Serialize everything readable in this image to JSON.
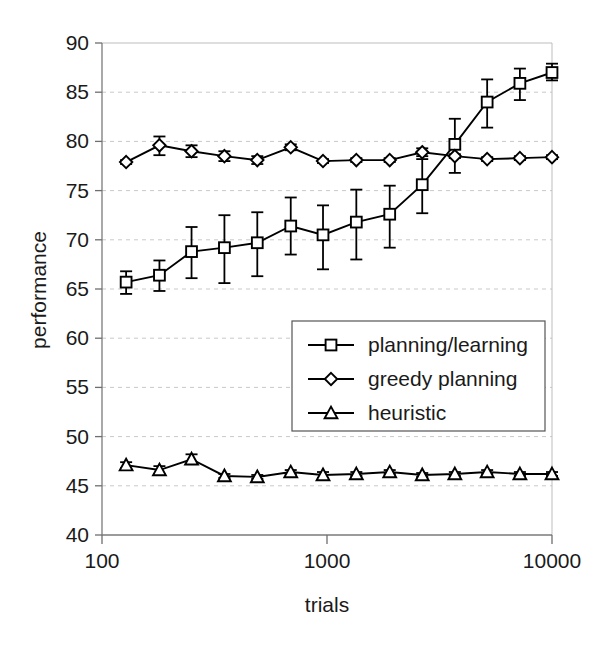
{
  "chart_data": {
    "type": "line",
    "title": "",
    "xlabel": "trials",
    "ylabel": "performance",
    "xscale": "log",
    "xlim": [
      100,
      10000
    ],
    "ylim": [
      40,
      90
    ],
    "ytick_labels": [
      "90",
      "85",
      "80",
      "75",
      "70",
      "65",
      "60",
      "55",
      "50",
      "45",
      "40"
    ],
    "yticks": [
      90,
      85,
      80,
      75,
      70,
      65,
      60,
      55,
      50,
      45,
      40
    ],
    "xtick_labels": [
      "100",
      "1000",
      "10000"
    ],
    "xticks": [
      100,
      1000,
      10000
    ],
    "grid": true,
    "legend_position": "center-right",
    "x": [
      128,
      180,
      250,
      350,
      490,
      690,
      960,
      1350,
      1900,
      2650,
      3700,
      5150,
      7200,
      10000
    ],
    "series": [
      {
        "name": "planning/learning",
        "marker": "square",
        "values": [
          65.7,
          66.4,
          68.8,
          69.2,
          69.7,
          71.4,
          70.5,
          71.8,
          72.6,
          75.6,
          79.7,
          84.0,
          85.9,
          87.0
        ],
        "err_low": [
          1.2,
          1.6,
          2.7,
          3.6,
          3.4,
          2.9,
          3.5,
          3.8,
          3.4,
          2.9,
          2.9,
          2.6,
          1.7,
          0.8
        ],
        "err_high": [
          1.1,
          1.5,
          2.5,
          3.3,
          3.1,
          2.9,
          3.0,
          3.3,
          2.9,
          2.6,
          2.6,
          2.3,
          1.5,
          0.9
        ]
      },
      {
        "name": "greedy planning",
        "marker": "diamond",
        "values": [
          77.9,
          79.6,
          79.0,
          78.5,
          78.1,
          79.4,
          78.0,
          78.1,
          78.1,
          78.9,
          78.5,
          78.2,
          78.3,
          78.4
        ],
        "err_low": [
          0.2,
          1.0,
          0.6,
          0.5,
          0.4,
          0.3,
          0.2,
          0.2,
          0.2,
          0.4,
          0.2,
          0.2,
          0.2,
          0.2
        ],
        "err_high": [
          0.2,
          0.9,
          0.6,
          0.5,
          0.4,
          0.3,
          0.2,
          0.2,
          0.2,
          0.4,
          0.2,
          0.2,
          0.2,
          0.2
        ]
      },
      {
        "name": "heuristic",
        "marker": "triangle",
        "values": [
          47.1,
          46.6,
          47.7,
          46.0,
          45.9,
          46.4,
          46.1,
          46.2,
          46.4,
          46.1,
          46.2,
          46.4,
          46.2,
          46.2
        ],
        "err_low": [
          0.3,
          0.4,
          0.5,
          0.2,
          0.2,
          0.2,
          0.3,
          0.2,
          0.2,
          0.2,
          0.2,
          0.2,
          0.2,
          0.2
        ],
        "err_high": [
          0.3,
          0.4,
          0.5,
          0.2,
          0.2,
          0.2,
          0.3,
          0.2,
          0.2,
          0.2,
          0.2,
          0.2,
          0.2,
          0.2
        ]
      }
    ]
  },
  "legend": {
    "entries": [
      {
        "label": "planning/learning",
        "marker": "square"
      },
      {
        "label": "greedy planning",
        "marker": "diamond"
      },
      {
        "label": "heuristic",
        "marker": "triangle"
      }
    ]
  },
  "axes": {
    "y_title": "performance",
    "x_title": "trials"
  }
}
